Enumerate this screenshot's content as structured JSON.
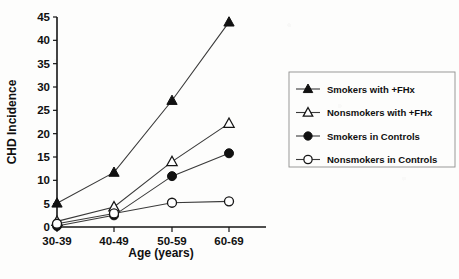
{
  "chart_data": {
    "type": "line",
    "title": "",
    "xlabel": "Age (years)",
    "ylabel": "CHD Incidence",
    "categories": [
      "30-39",
      "40-49",
      "50-59",
      "60-69"
    ],
    "ylim": [
      0,
      45
    ],
    "yticks": [
      0,
      5,
      10,
      15,
      20,
      25,
      30,
      35,
      40,
      45
    ],
    "ytick_labels": [
      "0",
      "5",
      "10",
      "15",
      "20",
      "25",
      "30",
      "35",
      "40",
      "45"
    ],
    "grid": false,
    "legend_position": "right",
    "series": [
      {
        "name": "Smokers with +FHx",
        "marker": "filled-triangle",
        "values": [
          5.1,
          11.7,
          27.1,
          43.9
        ]
      },
      {
        "name": "Nonsmokers with +FHx",
        "marker": "open-triangle",
        "values": [
          1.2,
          4.3,
          14.0,
          22.2
        ]
      },
      {
        "name": "Smokers in Controls",
        "marker": "filled-circle",
        "values": [
          0.2,
          2.5,
          10.9,
          15.8
        ]
      },
      {
        "name": "Nonsmokers in Controls",
        "marker": "open-circle",
        "values": [
          0.7,
          2.9,
          5.2,
          5.5
        ]
      }
    ]
  },
  "legend": {
    "items": [
      {
        "label": "Smokers with +FHx",
        "marker": "filled-triangle"
      },
      {
        "label": "Nonsmokers with +FHx",
        "marker": "open-triangle"
      },
      {
        "label": "Smokers in Controls",
        "marker": "filled-circle"
      },
      {
        "label": "Nonsmokers in Controls",
        "marker": "open-circle"
      }
    ]
  },
  "colors": {
    "axis": "#151515",
    "line": "#3a3a3a",
    "marker_fill": "#111111",
    "marker_open_fill": "#ffffff",
    "legend_border": "#8e8e8e",
    "background": "#fdfdfc"
  }
}
